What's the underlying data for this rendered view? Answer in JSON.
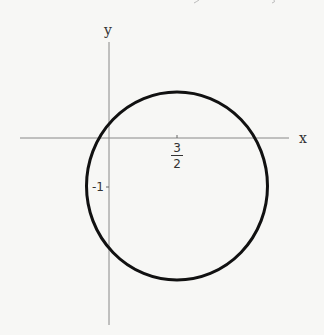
{
  "diagram": {
    "type": "circle-plot",
    "axes": {
      "x_label": "x",
      "y_label": "y"
    },
    "ticks": {
      "x_tick": {
        "numerator": "3",
        "denominator": "2",
        "value": 1.5
      },
      "y_tick": {
        "label": "-1",
        "value": -1
      }
    },
    "circle": {
      "center": [
        1.5,
        -1
      ],
      "stroke_color": "#111111"
    },
    "colors": {
      "axis": "#888888",
      "curve": "#111111",
      "text": "#333333",
      "background": "#f7f7f5"
    }
  }
}
